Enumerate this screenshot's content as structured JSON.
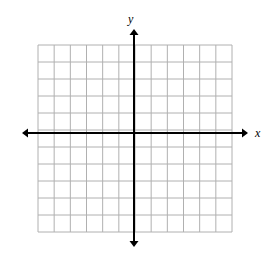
{
  "figure": {
    "kind": "cartesian-coordinate-grid",
    "background_color": "#ffffff",
    "grid": {
      "columns": 12,
      "rows": 11,
      "left": 38,
      "top": 45,
      "right": 232,
      "bottom": 232,
      "cell_width": 16.17,
      "cell_height": 17.0,
      "line_color": "#b0b0b0",
      "line_width": 1
    },
    "axes": {
      "color": "#000000",
      "line_width": 2,
      "arrowhead": true,
      "x_axis": {
        "label": "x",
        "y_position": 133,
        "start_x": 22,
        "end_x": 248
      },
      "y_axis": {
        "label": "y",
        "x_position": 134,
        "start_y": 29,
        "end_y": 247
      }
    },
    "tick_labels": [],
    "plotted_data": []
  },
  "chart_data": {
    "type": "scatter",
    "title": "",
    "xlabel": "x",
    "ylabel": "y",
    "x": [],
    "y": [],
    "xlim": [
      -6,
      6
    ],
    "ylim": [
      -6,
      5
    ],
    "grid": true,
    "legend": "none",
    "xticks": [],
    "yticks": []
  }
}
